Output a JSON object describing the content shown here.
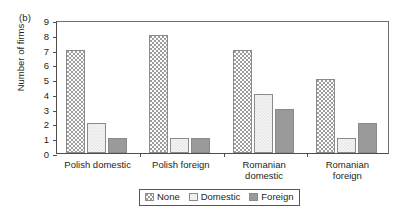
{
  "figure": {
    "panel_label": "(b)"
  },
  "chart_data": {
    "type": "bar",
    "title": "",
    "subtitle": "",
    "xlabel": "",
    "ylabel": "Number of firms",
    "ylim": [
      0,
      9
    ],
    "ytick_step": 1,
    "yticks": [
      "0",
      "1",
      "2",
      "3",
      "4",
      "5",
      "6",
      "7",
      "8",
      "9"
    ],
    "grid": false,
    "legend_position": "bottom-center",
    "categories": [
      "Polish domestic",
      "Polish foreign",
      "Romanian\ndomestic",
      "Romanian\nforeign"
    ],
    "series": [
      {
        "name": "None",
        "values": [
          7,
          8,
          7,
          5
        ],
        "pattern": "dots",
        "color": "#fdfdfd"
      },
      {
        "name": "Domestic",
        "values": [
          2,
          1,
          4,
          1
        ],
        "pattern": "crosshatch",
        "color": "#e6e6e6"
      },
      {
        "name": "Foreign",
        "values": [
          1,
          1,
          3,
          2
        ],
        "pattern": "dashes",
        "color": "#fdfdfd"
      }
    ]
  },
  "legend": {
    "items": [
      {
        "label": "None"
      },
      {
        "label": "Domestic"
      },
      {
        "label": "Foreign"
      }
    ]
  }
}
